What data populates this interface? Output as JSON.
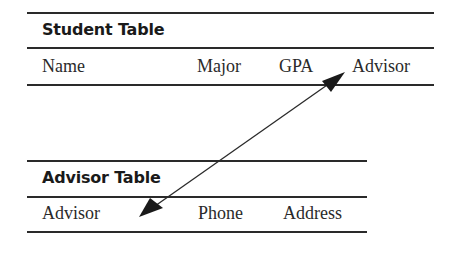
{
  "student_table": {
    "title": "Student Table",
    "columns": [
      "Name",
      "Major",
      "GPA",
      "Advisor"
    ]
  },
  "advisor_table": {
    "title": "Advisor Table",
    "columns": [
      "Advisor",
      "Phone",
      "Address"
    ]
  },
  "relationship": {
    "from": "Student Table.Advisor",
    "to": "Advisor Table.Advisor",
    "type": "double-headed-arrow"
  },
  "colors": {
    "line": "#2a2a2a",
    "text": "#1a1a1a",
    "background": "#ffffff"
  }
}
